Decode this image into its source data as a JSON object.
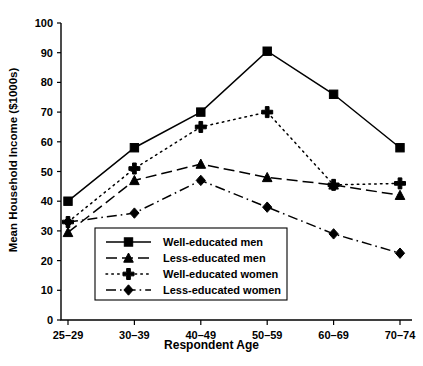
{
  "chart_data": {
    "type": "line",
    "title": "",
    "xlabel": "Respondent Age",
    "ylabel": "Mean Household Income ($1000s)",
    "categories": [
      "25–29",
      "30–39",
      "40–49",
      "50–59",
      "60–69",
      "70–74"
    ],
    "ylim": [
      0,
      100
    ],
    "yticks": [
      0,
      10,
      20,
      30,
      40,
      50,
      60,
      70,
      80,
      90,
      100
    ],
    "ytick_labels": [
      "0",
      "10",
      "20",
      "30",
      "40",
      "50",
      "60",
      "70",
      "80",
      "90",
      "100"
    ],
    "grid": false,
    "legend_position": "lower-center-inside",
    "series": [
      {
        "name": "Well-educated men",
        "marker": "square",
        "linestyle": "solid",
        "color": "#000000",
        "values": [
          40,
          58,
          70,
          90.5,
          76,
          58
        ]
      },
      {
        "name": "Less-educated men",
        "marker": "triangle",
        "linestyle": "dashed",
        "color": "#000000",
        "values": [
          29.5,
          47,
          52.5,
          48,
          45.5,
          42
        ]
      },
      {
        "name": "Well-educated women",
        "marker": "plus",
        "linestyle": "dotted",
        "color": "#000000",
        "values": [
          33,
          51,
          65,
          70,
          45.5,
          46
        ]
      },
      {
        "name": "Less-educated women",
        "marker": "diamond",
        "linestyle": "dashdot",
        "color": "#000000",
        "values": [
          33,
          36,
          47,
          38,
          29,
          22.5
        ]
      }
    ]
  }
}
